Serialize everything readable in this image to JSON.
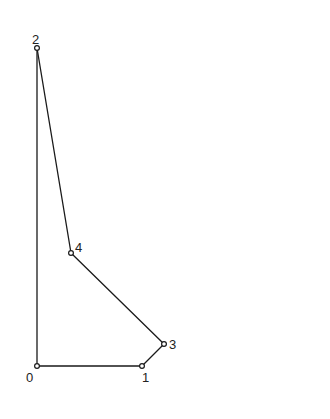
{
  "diagram": {
    "type": "linkage-graph",
    "stroke_color": "#1a1a1a",
    "background": "#ffffff",
    "nodes": [
      {
        "id": "0",
        "label": "0",
        "x": 37,
        "y": 366,
        "label_x": 26,
        "label_y": 382
      },
      {
        "id": "1",
        "label": "1",
        "x": 142,
        "y": 366,
        "label_x": 142,
        "label_y": 382
      },
      {
        "id": "2",
        "label": "2",
        "x": 37,
        "y": 48,
        "label_x": 32,
        "label_y": 44
      },
      {
        "id": "3",
        "label": "3",
        "x": 164,
        "y": 344,
        "label_x": 169,
        "label_y": 349
      },
      {
        "id": "4",
        "label": "4",
        "x": 71,
        "y": 253,
        "label_x": 75,
        "label_y": 252
      }
    ],
    "edges": [
      {
        "from": "0",
        "to": "1"
      },
      {
        "from": "0",
        "to": "2"
      },
      {
        "from": "2",
        "to": "4"
      },
      {
        "from": "4",
        "to": "3"
      },
      {
        "from": "3",
        "to": "1"
      }
    ]
  }
}
